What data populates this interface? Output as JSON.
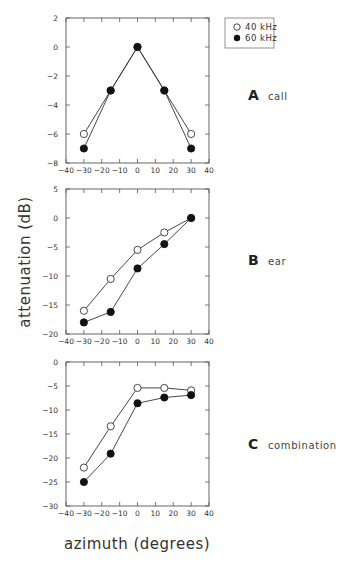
{
  "legend": {
    "entries": [
      {
        "label": "40 kHz",
        "marker": "open-circle"
      },
      {
        "label": "60 kHz",
        "marker": "filled-circle"
      }
    ]
  },
  "axes": {
    "ylabel": "attenuation (dB)",
    "xlabel": "azimuth (degrees)"
  },
  "chart_data": [
    {
      "type": "line",
      "title": "call",
      "panel": "A",
      "xlabel": "azimuth (degrees)",
      "ylabel": "attenuation (dB)",
      "x": [
        -30,
        -15,
        0,
        15,
        30
      ],
      "xlim": [
        -40,
        40
      ],
      "xticks": [
        -40,
        -30,
        -20,
        -10,
        0,
        10,
        20,
        30,
        40
      ],
      "ylim": [
        -8,
        2
      ],
      "yticks": [
        2,
        0,
        -2,
        -4,
        -6,
        -8
      ],
      "grid": false,
      "legend_position": "top-right outside",
      "series": [
        {
          "name": "40 kHz",
          "marker": "open-circle",
          "values": [
            -6,
            -3,
            0,
            -3,
            -6
          ]
        },
        {
          "name": "60 kHz",
          "marker": "filled-circle",
          "values": [
            -7,
            -3,
            0,
            -3,
            -7
          ]
        }
      ]
    },
    {
      "type": "line",
      "title": "ear",
      "panel": "B",
      "xlabel": "azimuth (degrees)",
      "ylabel": "attenuation (dB)",
      "x": [
        -30,
        -15,
        0,
        15,
        30
      ],
      "xlim": [
        -40,
        40
      ],
      "xticks": [
        -40,
        -30,
        -20,
        -10,
        0,
        10,
        20,
        30,
        40
      ],
      "ylim": [
        -20,
        5
      ],
      "yticks": [
        5,
        0,
        -5,
        -10,
        -15,
        -20
      ],
      "grid": false,
      "series": [
        {
          "name": "40 kHz",
          "marker": "open-circle",
          "values": [
            -16,
            -10.5,
            -5.5,
            -2.5,
            0
          ]
        },
        {
          "name": "60 kHz",
          "marker": "filled-circle",
          "values": [
            -18,
            -16.2,
            -8.7,
            -4.5,
            0
          ]
        }
      ]
    },
    {
      "type": "line",
      "title": "combination",
      "panel": "C",
      "xlabel": "azimuth (degrees)",
      "ylabel": "attenuation (dB)",
      "x": [
        -30,
        -15,
        0,
        15,
        30
      ],
      "xlim": [
        -40,
        40
      ],
      "xticks": [
        -40,
        -30,
        -20,
        -10,
        0,
        10,
        20,
        30,
        40
      ],
      "ylim": [
        -30,
        0
      ],
      "yticks": [
        0,
        -5,
        -10,
        -15,
        -20,
        -25,
        -30
      ],
      "grid": false,
      "series": [
        {
          "name": "40 kHz",
          "marker": "open-circle",
          "values": [
            -22,
            -13.4,
            -5.4,
            -5.4,
            -5.9
          ]
        },
        {
          "name": "60 kHz",
          "marker": "filled-circle",
          "values": [
            -25,
            -19.1,
            -8.6,
            -7.4,
            -6.9
          ]
        }
      ]
    }
  ]
}
